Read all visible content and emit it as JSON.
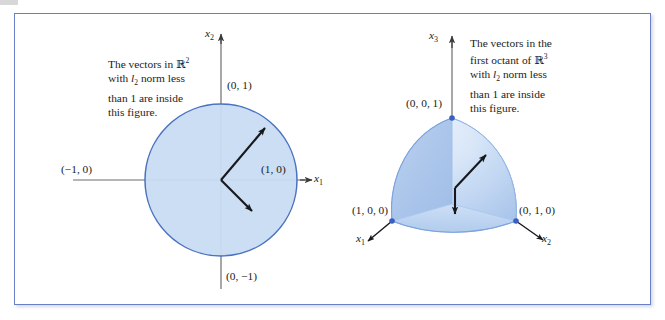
{
  "figure": {
    "background_color": "#ffffff",
    "frame_border_color": "#6a7fc6",
    "shape_fill_color": "#c8dcf2",
    "shape_stroke_color": "#4a72c0",
    "vertex_dot_color": "#3a5fc0",
    "vector_color": "#16181c"
  },
  "panel_2d": {
    "caption": {
      "line1_a": "The vectors in ",
      "line1_bbR": "R",
      "line1_sup": "2",
      "line2_a": "with ",
      "line2_l": "l",
      "line2_sub": "2",
      "line2_b": " norm less",
      "line3": "than 1 are inside",
      "line4": "this figure."
    },
    "axis_labels": {
      "vertical": {
        "name": "x",
        "sub": "2"
      },
      "horizontal": {
        "name": "x",
        "sub": "1"
      }
    },
    "points": {
      "top": "(0, 1)",
      "left": "(−1, 0)",
      "right": "(1, 0)",
      "bottom": "(0, −1)"
    },
    "shape": "unit-circle-l2-ball",
    "vectors": [
      {
        "name": "vector-upper-right",
        "from": [
          0,
          0
        ],
        "to": [
          0.62,
          0.7
        ]
      },
      {
        "name": "vector-lower-right",
        "from": [
          0,
          0
        ],
        "to": [
          0.47,
          -0.4
        ]
      }
    ]
  },
  "panel_3d": {
    "caption": {
      "line1": "The vectors in the",
      "line2_a": "first octant of ",
      "line2_bbR": "R",
      "line2_sup": "3",
      "line3_a": "with ",
      "line3_l": "l",
      "line3_sub": "2",
      "line3_b": " norm  less",
      "line4": "than 1 are inside",
      "line5": "this figure."
    },
    "axis_labels": {
      "vertical": {
        "name": "x",
        "sub": "3"
      },
      "left": {
        "name": "x",
        "sub": "1"
      },
      "right": {
        "name": "x",
        "sub": "2"
      }
    },
    "points": {
      "top": "(0, 0, 1)",
      "left": "(1, 0, 0)",
      "right": "(0, 1, 0)"
    },
    "shape": "first-octant-spherical-sector",
    "vectors": [
      {
        "name": "vector-up-right",
        "direction": "up-right"
      },
      {
        "name": "vector-down",
        "direction": "down"
      }
    ]
  }
}
